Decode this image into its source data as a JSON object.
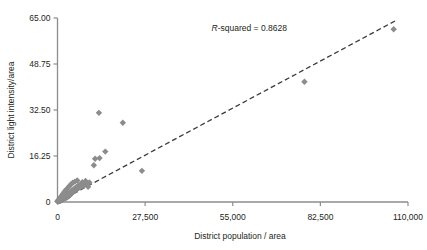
{
  "chart_data": {
    "type": "scatter",
    "title": "",
    "xlabel": "District population / area",
    "ylabel": "District light intensity/area",
    "xlim": [
      0,
      110000
    ],
    "ylim": [
      0,
      65.0
    ],
    "grid": false,
    "legend": null,
    "xticks": [
      0,
      27500,
      55000,
      82500,
      110000
    ],
    "xtick_labels": [
      "0",
      "27,500",
      "55,000",
      "82,500",
      "110,000"
    ],
    "yticks": [
      0,
      16.25,
      32.5,
      48.75,
      65.0
    ],
    "ytick_labels": [
      "0",
      "16.25",
      "32.50",
      "48.75",
      "65.00"
    ],
    "annotations": [
      {
        "name": "r-squared-annotation",
        "text_italic": "R",
        "text": "-squared = 0.8628",
        "x": 72000,
        "y": 60.5
      }
    ],
    "trendline": {
      "type": "linear-dashed",
      "x_start": 2800,
      "y_start": 1.6,
      "x_end": 106000,
      "y_end": 64.0,
      "color": "#3b3b3b",
      "dash": "5,3",
      "width": 1.3
    },
    "marker": {
      "shape": "diamond",
      "color": "#8c8c8c",
      "size": 5.2
    },
    "series": [
      {
        "name": "districts",
        "points": [
          [
            105500,
            61.0
          ],
          [
            77500,
            42.5
          ],
          [
            26500,
            11.0
          ],
          [
            20500,
            28.0
          ],
          [
            13000,
            31.5
          ],
          [
            15000,
            17.8
          ],
          [
            13200,
            15.5
          ],
          [
            11800,
            15.3
          ],
          [
            11400,
            13.0
          ],
          [
            9200,
            6.6
          ],
          [
            8500,
            6.1
          ],
          [
            8000,
            5.6
          ],
          [
            7600,
            6.3
          ],
          [
            7200,
            5.2
          ],
          [
            6900,
            5.8
          ],
          [
            6600,
            4.9
          ],
          [
            6300,
            5.4
          ],
          [
            6000,
            4.4
          ],
          [
            5800,
            5.0
          ],
          [
            5600,
            4.1
          ],
          [
            5400,
            4.7
          ],
          [
            5200,
            3.9
          ],
          [
            5000,
            4.4
          ],
          [
            4800,
            3.6
          ],
          [
            4700,
            4.1
          ],
          [
            4600,
            3.3
          ],
          [
            4500,
            3.8
          ],
          [
            4400,
            3.0
          ],
          [
            4300,
            3.5
          ],
          [
            4200,
            2.8
          ],
          [
            4100,
            3.3
          ],
          [
            4000,
            2.6
          ],
          [
            3900,
            3.0
          ],
          [
            3800,
            2.4
          ],
          [
            3700,
            2.9
          ],
          [
            3600,
            2.2
          ],
          [
            3500,
            2.7
          ],
          [
            3400,
            2.0
          ],
          [
            3300,
            2.5
          ],
          [
            3200,
            1.9
          ],
          [
            3100,
            2.3
          ],
          [
            3000,
            1.7
          ],
          [
            2900,
            2.1
          ],
          [
            2800,
            1.6
          ],
          [
            2700,
            2.0
          ],
          [
            2600,
            1.5
          ],
          [
            2500,
            1.9
          ],
          [
            2400,
            1.4
          ],
          [
            2300,
            1.8
          ],
          [
            2200,
            1.3
          ],
          [
            2100,
            1.7
          ],
          [
            2000,
            1.2
          ],
          [
            1950,
            1.6
          ],
          [
            1900,
            1.1
          ],
          [
            1850,
            1.5
          ],
          [
            1800,
            1.0
          ],
          [
            1750,
            1.4
          ],
          [
            1700,
            0.95
          ],
          [
            1650,
            1.3
          ],
          [
            1600,
            0.9
          ],
          [
            1550,
            1.25
          ],
          [
            1500,
            0.85
          ],
          [
            1450,
            1.2
          ],
          [
            1400,
            0.8
          ],
          [
            1350,
            1.15
          ],
          [
            1300,
            0.75
          ],
          [
            1250,
            1.1
          ],
          [
            1200,
            0.7
          ],
          [
            1150,
            1.05
          ],
          [
            1100,
            0.65
          ],
          [
            1050,
            1.0
          ],
          [
            1000,
            0.6
          ],
          [
            960,
            0.95
          ],
          [
            920,
            0.55
          ],
          [
            880,
            0.9
          ],
          [
            840,
            0.5
          ],
          [
            800,
            0.85
          ],
          [
            760,
            0.48
          ],
          [
            720,
            0.8
          ],
          [
            680,
            0.45
          ],
          [
            640,
            0.75
          ],
          [
            600,
            0.42
          ],
          [
            560,
            0.7
          ],
          [
            520,
            0.4
          ],
          [
            480,
            0.65
          ],
          [
            440,
            0.38
          ],
          [
            400,
            0.6
          ],
          [
            370,
            0.35
          ],
          [
            340,
            0.55
          ],
          [
            310,
            0.32
          ],
          [
            280,
            0.5
          ],
          [
            250,
            0.3
          ],
          [
            220,
            0.45
          ],
          [
            190,
            0.28
          ],
          [
            160,
            0.4
          ],
          [
            130,
            0.25
          ],
          [
            110,
            0.35
          ],
          [
            90,
            0.22
          ],
          [
            70,
            0.3
          ],
          [
            50,
            0.18
          ],
          [
            4200,
            6.2
          ],
          [
            4800,
            6.8
          ],
          [
            5500,
            7.2
          ],
          [
            6200,
            7.6
          ],
          [
            3600,
            5.5
          ],
          [
            3100,
            4.8
          ],
          [
            2600,
            4.2
          ],
          [
            2200,
            3.6
          ],
          [
            1800,
            3.0
          ],
          [
            1500,
            2.5
          ],
          [
            1200,
            2.0
          ],
          [
            950,
            1.6
          ],
          [
            750,
            1.3
          ],
          [
            560,
            1.0
          ],
          [
            420,
            0.8
          ],
          [
            300,
            0.6
          ],
          [
            200,
            0.45
          ],
          [
            7800,
            7.0
          ],
          [
            8800,
            7.4
          ],
          [
            10000,
            6.9
          ],
          [
            6800,
            6.0
          ],
          [
            5900,
            5.2
          ],
          [
            4400,
            4.0
          ],
          [
            3300,
            3.1
          ],
          [
            2400,
            2.4
          ],
          [
            1700,
            1.9
          ],
          [
            1150,
            1.45
          ],
          [
            700,
            1.1
          ],
          [
            9600,
            5.4
          ]
        ]
      }
    ]
  },
  "axes": {
    "spine_color": "#8c8c8c",
    "tick_color": "#8c8c8c"
  }
}
